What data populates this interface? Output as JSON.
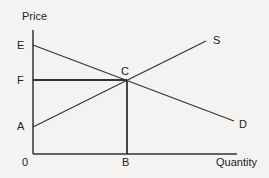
{
  "diagram": {
    "axes": {
      "y_label": "Price",
      "x_label": "Quantity",
      "origin_label": "0"
    },
    "points": {
      "E": "E",
      "F": "F",
      "A": "A",
      "C": "C",
      "B": "B"
    },
    "curves": {
      "supply": "S",
      "demand": "D"
    },
    "colors": {
      "line": "#333333",
      "background": "#f4f3f1"
    }
  }
}
